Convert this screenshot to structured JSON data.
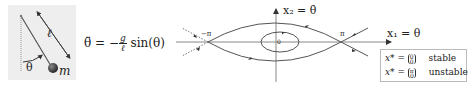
{
  "pendulum": {
    "length_label": "ℓ",
    "angle_label": "θ",
    "mass_label": "m",
    "background": "#eeeeee"
  },
  "equation": {
    "lhs": "θ̈ = −",
    "frac_num": "g",
    "frac_den": "ℓ",
    "rhs": "sin(θ)"
  },
  "phase_portrait": {
    "y_axis_label": "x₂ = θ̇",
    "x_axis_label": "x₁ = θ",
    "neg_pi_label": "−π",
    "pi_label": "π",
    "origin_label": "0"
  },
  "legend": {
    "rows": [
      {
        "prefix": "x* = ",
        "top": "0",
        "bottom": "0",
        "status": "stable"
      },
      {
        "prefix": "x* = ",
        "top": "π",
        "bottom": "0",
        "status": "unstable"
      }
    ]
  }
}
